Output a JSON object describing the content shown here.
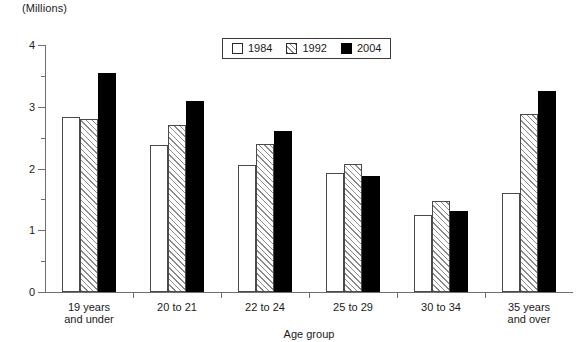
{
  "chart_data": {
    "type": "bar",
    "title": "",
    "xlabel": "Age group",
    "ylabel": "(Millions)",
    "ylim": [
      0,
      4
    ],
    "ytick_labels": [
      "0",
      "1",
      "2",
      "3",
      "4"
    ],
    "ytick_values": [
      0,
      1,
      2,
      3,
      4
    ],
    "yminor_values": [
      0.5,
      1.5,
      2.5,
      3.5
    ],
    "grid": false,
    "legend_position": "top-center",
    "categories": [
      "19 years\nand under",
      "20 to 21",
      "22 to 24",
      "25 to 29",
      "30 to 34",
      "35 years\nand over"
    ],
    "series": [
      {
        "name": "1984",
        "fill": "white",
        "values": [
          2.84,
          2.38,
          2.06,
          1.93,
          1.24,
          1.6
        ]
      },
      {
        "name": "1992",
        "fill": "hatched",
        "values": [
          2.8,
          2.7,
          2.4,
          2.08,
          1.48,
          2.89
        ]
      },
      {
        "name": "2004",
        "fill": "black",
        "values": [
          3.55,
          3.09,
          2.6,
          1.88,
          1.32,
          3.25
        ]
      }
    ]
  },
  "colors": {
    "series_1984": "#ffffff",
    "series_1992": "#ffffff",
    "series_2004": "#000000",
    "axis": "#6f6f6f",
    "outline": "#4a4a4a",
    "text": "#1a1a1a"
  }
}
